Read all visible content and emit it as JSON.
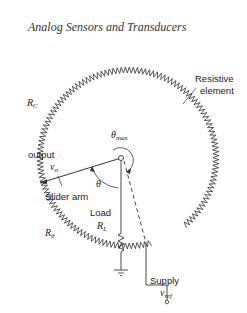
{
  "header": {
    "title": "Analog Sensors and Transducers"
  },
  "diagram": {
    "labels": {
      "resistive_element_1": "Resistive",
      "resistive_element_2": "element",
      "rc": "R",
      "rc_sub": "C",
      "output": "output",
      "vo": "v",
      "vo_sub": "o",
      "slider_arm": "Slider arm",
      "theta": "θ",
      "theta_max": "θ",
      "theta_max_sub": "max",
      "load": "Load",
      "rl": "R",
      "rl_sub": "L",
      "rtheta": "R",
      "rtheta_sub": "θ",
      "supply": "Supply",
      "vref": "v",
      "vref_sub": "ref"
    }
  }
}
